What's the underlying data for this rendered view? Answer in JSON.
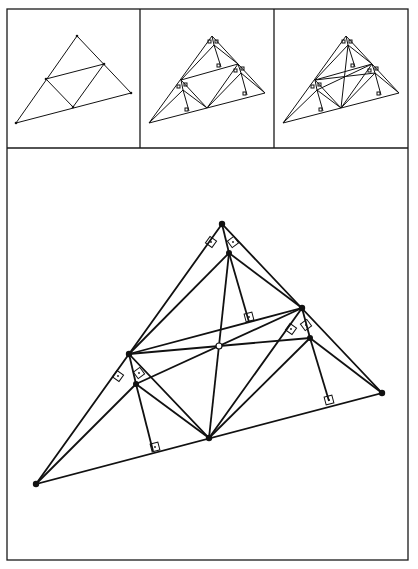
{
  "figure": {
    "frame": {
      "x": 7,
      "y": 9,
      "width": 401,
      "height": 551,
      "divider_y": 148,
      "panel_dividers_x": [
        140,
        274
      ]
    },
    "panels": [
      {
        "id": "step-1",
        "label": "Triangle with medial triangle",
        "vertices": {
          "A": [
            77,
            36
          ],
          "B": [
            16,
            123
          ],
          "C": [
            131,
            93
          ]
        },
        "midpoints": {
          "Mab": [
            46,
            79
          ],
          "Mac": [
            104,
            64
          ],
          "Mbc": [
            73,
            107
          ]
        }
      },
      {
        "id": "step-2",
        "label": "Perpendiculars in corner triangles"
      },
      {
        "id": "step-3",
        "label": "Connecting lines through center"
      }
    ],
    "main": {
      "vertices": {
        "A": [
          222,
          224
        ],
        "B": [
          36,
          484
        ],
        "C": [
          382,
          393
        ]
      },
      "midpoints": {
        "Mab": [
          129,
          354
        ],
        "Mac": [
          302,
          308
        ],
        "Mbc": [
          209,
          438
        ]
      },
      "inner_points": {
        "Pa": [
          229,
          253
        ],
        "Pb": [
          136,
          384
        ],
        "Pc": [
          310,
          338
        ]
      },
      "feet": {
        "Fa": [
          249,
          322
        ],
        "Fb": [
          153,
          451
        ],
        "Fc": [
          329,
          401
        ]
      },
      "center": [
        219,
        346
      ],
      "center_style": "open-circle"
    }
  }
}
